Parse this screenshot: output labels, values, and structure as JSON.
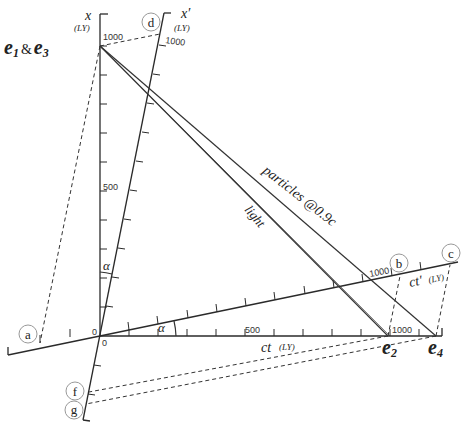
{
  "diagram": {
    "axes": {
      "x": {
        "label": "x",
        "unit": "(LY)",
        "tick_1000": "1000",
        "tick_500": "500",
        "origin": "0"
      },
      "x_prime": {
        "label": "x′",
        "unit": "(LY)",
        "tick_1000": "1000"
      },
      "ct": {
        "label": "ct",
        "unit": "(LY)",
        "tick_500": "500",
        "tick_1000": "1000",
        "origin": "0"
      },
      "ct_prime": {
        "label": "ct′",
        "unit": "(LY)",
        "tick_1000": "1000"
      }
    },
    "events": {
      "e1_e3": {
        "label_a": "e",
        "sub_a": "1",
        "amp": "&",
        "label_b": "e",
        "sub_b": "3"
      },
      "e2": {
        "label": "e",
        "sub": "2"
      },
      "e4": {
        "label": "e",
        "sub": "4"
      }
    },
    "worldlines": {
      "light": "light",
      "particles": "particles @0.9c"
    },
    "angle_label": "α",
    "markers": [
      "a",
      "b",
      "c",
      "d",
      "f",
      "g"
    ]
  }
}
